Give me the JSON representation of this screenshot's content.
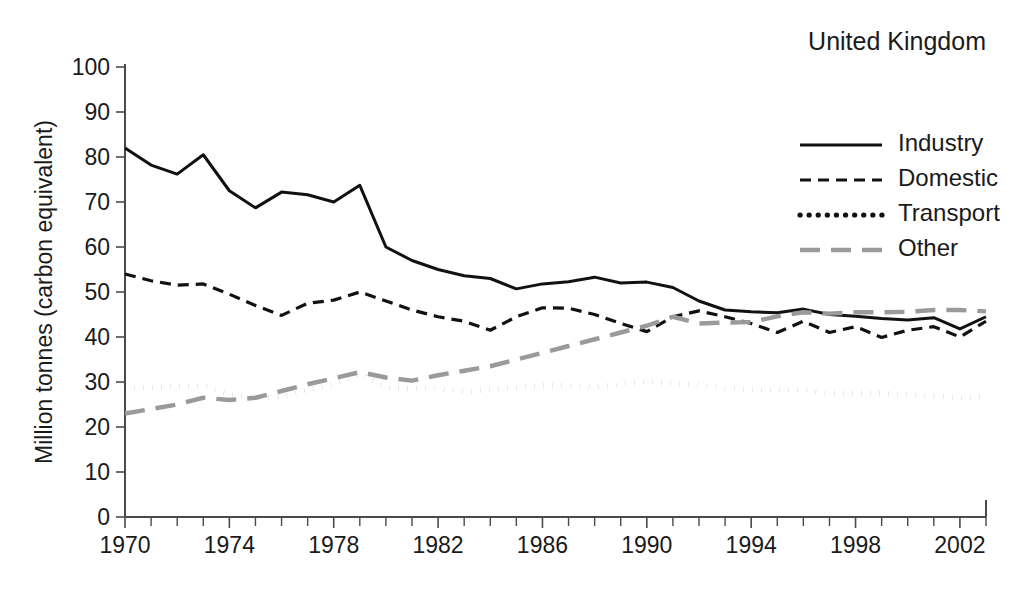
{
  "chart_data": {
    "type": "line",
    "title": "United Kingdom",
    "xlabel": "",
    "ylabel": "Million tonnes (carbon equivalent)",
    "xlim": [
      1970,
      2003
    ],
    "ylim": [
      0,
      100
    ],
    "grid": false,
    "legend_position": "top-right",
    "x_tick_labels": [
      "1970",
      "1974",
      "1978",
      "1982",
      "1986",
      "1990",
      "1994",
      "1998",
      "2002"
    ],
    "x_tick_values": [
      1970,
      1974,
      1978,
      1982,
      1986,
      1990,
      1994,
      1998,
      2002
    ],
    "x_minor_tick_step": 1,
    "y_tick_labels": [
      "0",
      "10",
      "20",
      "30",
      "40",
      "50",
      "60",
      "70",
      "80",
      "90",
      "100"
    ],
    "y_tick_values": [
      0,
      10,
      20,
      30,
      40,
      50,
      60,
      70,
      80,
      90,
      100
    ],
    "x": [
      1970,
      1971,
      1972,
      1973,
      1974,
      1975,
      1976,
      1977,
      1978,
      1979,
      1980,
      1981,
      1982,
      1983,
      1984,
      1985,
      1986,
      1987,
      1988,
      1989,
      1990,
      1991,
      1992,
      1993,
      1994,
      1995,
      1996,
      1997,
      1998,
      1999,
      2000,
      2001,
      2002,
      2003
    ],
    "series": [
      {
        "name": "Industry",
        "style": "solid",
        "color": "#111111",
        "values": [
          82.0,
          78.2,
          76.2,
          80.5,
          72.5,
          68.7,
          72.2,
          71.6,
          70.0,
          73.7,
          60.0,
          57.0,
          55.0,
          53.6,
          53.0,
          50.7,
          51.8,
          52.3,
          53.3,
          52.0,
          52.2,
          51.0,
          48.0,
          46.0,
          45.6,
          45.4,
          46.2,
          45.0,
          44.6,
          44.1,
          43.8,
          44.3,
          41.8,
          44.5
        ]
      },
      {
        "name": "Domestic",
        "style": "dashed",
        "color": "#111111",
        "values": [
          54.0,
          52.5,
          51.5,
          51.8,
          49.5,
          47.0,
          44.8,
          47.5,
          48.2,
          50.0,
          48.0,
          46.0,
          44.5,
          43.5,
          41.5,
          44.5,
          46.5,
          46.4,
          45.0,
          43.0,
          41.2,
          44.5,
          45.8,
          44.5,
          43.0,
          41.0,
          43.5,
          41.0,
          42.3,
          39.9,
          41.5,
          42.3,
          40.0,
          43.5
        ]
      },
      {
        "name": "Transport",
        "style": "dotted",
        "color": "#111111",
        "values": [
          28.7,
          28.8,
          29.0,
          29.2,
          27.2,
          26.5,
          26.7,
          28.2,
          29.5,
          31.8,
          28.8,
          28.5,
          28.5,
          27.8,
          28.3,
          28.8,
          29.3,
          29.3,
          28.8,
          29.6,
          29.9,
          29.6,
          29.4,
          28.7,
          28.2,
          28.1,
          28.2,
          27.6,
          27.6,
          27.5,
          27.2,
          26.9,
          26.4,
          26.7
        ]
      },
      {
        "name": "Other",
        "style": "long-dashed",
        "color": "#9a9a9a",
        "values": [
          23.0,
          24.0,
          25.0,
          26.5,
          26.0,
          26.5,
          28.0,
          29.5,
          30.8,
          32.2,
          31.0,
          30.3,
          31.5,
          32.5,
          33.5,
          35.0,
          36.5,
          38.0,
          39.5,
          41.0,
          42.5,
          44.5,
          43.0,
          43.2,
          43.3,
          44.6,
          45.5,
          45.2,
          45.5,
          45.5,
          45.6,
          46.0,
          46.0,
          45.7
        ]
      }
    ]
  },
  "legend": {
    "entries": [
      {
        "label": "Industry",
        "style": "solid",
        "color": "#111111"
      },
      {
        "label": "Domestic",
        "style": "dashed",
        "color": "#111111"
      },
      {
        "label": "Transport",
        "style": "dotted",
        "color": "#111111"
      },
      {
        "label": "Other",
        "style": "long-dashed",
        "color": "#9a9a9a"
      }
    ]
  }
}
